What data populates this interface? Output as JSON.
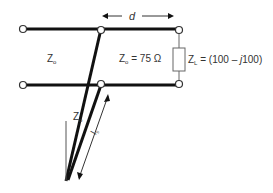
{
  "diagram": {
    "labels": {
      "d": "d",
      "z0_main": "Z",
      "z0_main_sub": "o",
      "z0_load_side": "Z",
      "z0_load_side_sub": "o",
      "z0_value": " = 75 Ω",
      "zl": "Z",
      "zl_sub": "L",
      "zl_value": " = (100 – ",
      "zl_j": "j",
      "zl_value_end": "100)",
      "stub_z0": "Z",
      "stub_z0_sub": "o",
      "stub_len": "l",
      "stub_len_sub": "s"
    },
    "colors": {
      "line": "#111111",
      "thin": "#444444",
      "text": "#333333",
      "node_fill": "#ffffff"
    }
  }
}
